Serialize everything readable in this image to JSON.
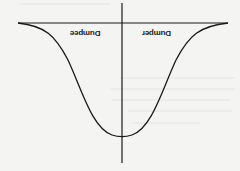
{
  "diagram": {
    "orientation": "rotated 180 degrees",
    "labels": {
      "left": "Dumpee",
      "right": "Dumper"
    },
    "curve": "inverted bell curve",
    "colors": {
      "line": "#1a1a1a",
      "background": "#f4f4f2"
    }
  }
}
